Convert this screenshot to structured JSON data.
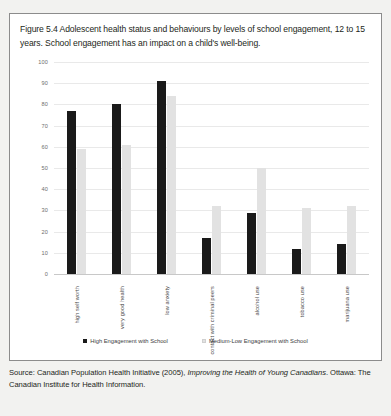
{
  "figure": {
    "title": "Figure 5.4 Adolescent health status and behaviours by levels of school engagement, 12 to 15 years. School engagement has an impact on a child's well-being.",
    "source_prefix": "Source: Canadian Population Health Initiative (2005), ",
    "source_italic": "Improving the Health of Young Canadians",
    "source_suffix": ". Ottawa: The Canadian Institute for Health Information."
  },
  "legend": {
    "items": [
      {
        "label": "High Engagement with School",
        "color": "#1a1a1a"
      },
      {
        "label": "Medium-Low Engagement with School",
        "color": "#e2e2e2"
      }
    ]
  },
  "chart_data": {
    "type": "bar",
    "title": "Adolescent health status and behaviours by levels of school engagement, 12 to 15 years",
    "xlabel": "",
    "ylabel": "",
    "ylim": [
      0,
      100
    ],
    "yticks": [
      100,
      90,
      80,
      70,
      60,
      50,
      40,
      30,
      20,
      10,
      0
    ],
    "grid": true,
    "legend_position": "bottom",
    "categories": [
      "high self worth",
      "very good health",
      "low anxiety",
      "contact with criminal peers",
      "alcohol use",
      "tobacco use",
      "marijuana use"
    ],
    "series": [
      {
        "name": "High Engagement with School",
        "color": "#1a1a1a",
        "values": [
          77,
          80,
          91,
          17,
          29,
          12,
          14
        ]
      },
      {
        "name": "Medium-Low Engagement with School",
        "color": "#e2e2e2",
        "values": [
          59,
          61,
          84,
          32,
          50,
          31,
          32
        ]
      }
    ]
  }
}
